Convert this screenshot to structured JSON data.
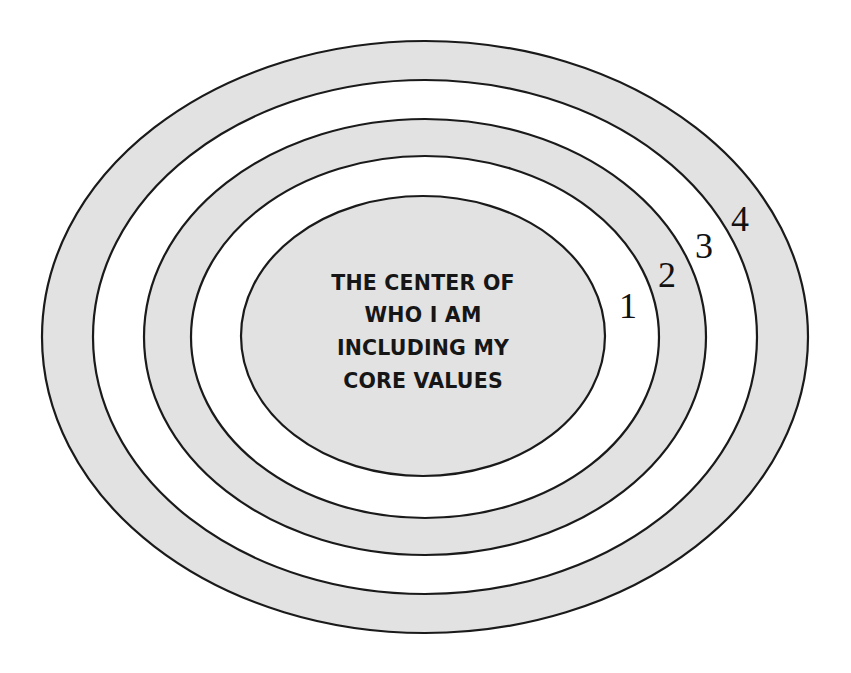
{
  "diagram": {
    "colors": {
      "shaded": "#e2e2e2",
      "unshaded": "#ffffff",
      "stroke": "#1a1a1a",
      "text": "#161616"
    },
    "center": {
      "lines": [
        "THE CENTER OF",
        "WHO I AM",
        "INCLUDING MY",
        "CORE VALUES"
      ]
    },
    "rings": [
      {
        "number": "1",
        "label": "1"
      },
      {
        "number": "2",
        "label": "2"
      },
      {
        "number": "3",
        "label": "3"
      },
      {
        "number": "4",
        "label": "4"
      }
    ]
  }
}
